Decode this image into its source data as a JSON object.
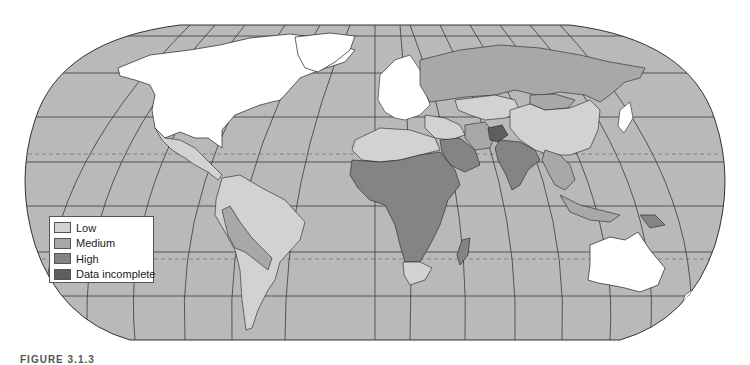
{
  "map": {
    "projection": "Robinson",
    "colors": {
      "ocean": "#b9b9b9",
      "graticule": "#3a3a3a",
      "tropics": "#777777",
      "no_category": "#ffffff",
      "coast": "#222222"
    },
    "legend": {
      "items": [
        {
          "label": "Low",
          "color": "#d2d2d2"
        },
        {
          "label": "Medium",
          "color": "#a8a8a8"
        },
        {
          "label": "High",
          "color": "#848484"
        },
        {
          "label": "Data incomplete",
          "color": "#5e5e5e"
        }
      ]
    },
    "regions": [
      {
        "name": "North America (US/Canada/Greenland)",
        "category": "none"
      },
      {
        "name": "Europe",
        "category": "none"
      },
      {
        "name": "Australia",
        "category": "none"
      },
      {
        "name": "Japan",
        "category": "none"
      },
      {
        "name": "Russia",
        "category": "Medium"
      },
      {
        "name": "China",
        "category": "Low"
      },
      {
        "name": "Kazakhstan",
        "category": "Low"
      },
      {
        "name": "Mongolia",
        "category": "Medium"
      },
      {
        "name": "Mexico & Central America",
        "category": "Low"
      },
      {
        "name": "South America (Brazil, Argentina, Chile)",
        "category": "Low"
      },
      {
        "name": "Peru / Bolivia / Paraguay",
        "category": "Medium"
      },
      {
        "name": "North Africa",
        "category": "Low"
      },
      {
        "name": "Sub-Saharan Africa",
        "category": "High"
      },
      {
        "name": "Saudi Arabia / Middle East",
        "category": "High"
      },
      {
        "name": "Iran",
        "category": "Medium"
      },
      {
        "name": "Afghanistan",
        "category": "Data incomplete"
      },
      {
        "name": "India",
        "category": "High"
      },
      {
        "name": "Southeast Asia",
        "category": "Medium"
      },
      {
        "name": "Madagascar",
        "category": "High"
      },
      {
        "name": "South Africa",
        "category": "Low"
      }
    ]
  },
  "caption": "FIGURE 3.1.3"
}
